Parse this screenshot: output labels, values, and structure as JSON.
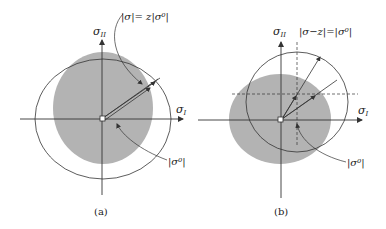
{
  "panels": [
    {
      "id": "a",
      "caption": "(a)",
      "axis_x_label": "σ",
      "axis_x_sub": "I",
      "axis_y_label": "σ",
      "axis_y_sub": "II",
      "top_annotation": "|σ|= z|σ⁰|",
      "bottom_annotation": "|σ⁰|"
    },
    {
      "id": "b",
      "caption": "(b)",
      "axis_x_label": "σ",
      "axis_x_sub": "I",
      "axis_y_label": "σ",
      "axis_y_sub": "II",
      "top_annotation": "|σ−z|=|σ⁰|",
      "bottom_annotation": "|σ⁰|"
    }
  ],
  "colors": {
    "shaded_region": "#b3b3b3",
    "line": "#333333",
    "background": "#ffffff"
  }
}
